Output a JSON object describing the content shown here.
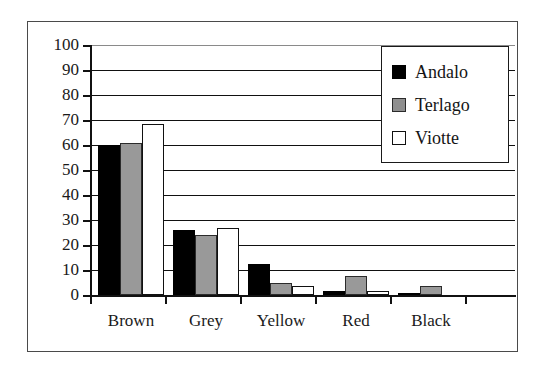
{
  "chart_data": {
    "type": "bar",
    "title": "",
    "xlabel": "",
    "ylabel": "",
    "ylim": [
      0,
      100
    ],
    "ytick_step": 10,
    "ytick_labels": [
      "100",
      "90",
      "80",
      "70",
      "60",
      "50",
      "40",
      "30",
      "20",
      "10",
      "0"
    ],
    "grid": true,
    "legend_position": "top-right",
    "categories": [
      "Brown",
      "Grey",
      "Yellow",
      "Red",
      "Black"
    ],
    "series": [
      {
        "name": "Andalo",
        "color": "#000000",
        "values": [
          60,
          26,
          12.5,
          1.5,
          1
        ]
      },
      {
        "name": "Terlago",
        "color": "#999999",
        "values": [
          61,
          24,
          5,
          7.5,
          3.5
        ]
      },
      {
        "name": "Viotte",
        "color": "#ffffff",
        "values": [
          68.5,
          27,
          3.5,
          1.5,
          0
        ]
      }
    ]
  },
  "legend": {
    "items": [
      {
        "label": "Andalo",
        "swatch": "black-square-icon"
      },
      {
        "label": "Terlago",
        "swatch": "grey-square-icon"
      },
      {
        "label": "Viotte",
        "swatch": "white-square-icon"
      }
    ]
  },
  "colors": {
    "axis": "#111111",
    "frame": "#4a4a4a",
    "background": "#ffffff",
    "series_andalo": "#000000",
    "series_terlago": "#999999",
    "series_viotte": "#ffffff"
  }
}
